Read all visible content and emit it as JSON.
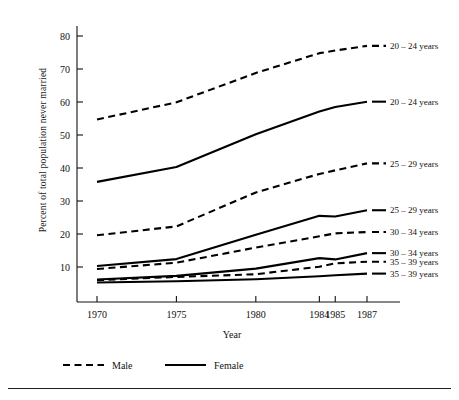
{
  "chart_data": {
    "type": "line",
    "title": "",
    "xlabel": "Year",
    "ylabel": "Percent of total population never married",
    "x": [
      1970,
      1975,
      1980,
      1984,
      1985,
      1987
    ],
    "xtick_labels": [
      "1970",
      "1975",
      "1980",
      "1984",
      "1985",
      "1987"
    ],
    "ytick_labels": [
      "10",
      "20",
      "30",
      "40",
      "50",
      "60",
      "70",
      "80"
    ],
    "yticks": [
      10,
      20,
      30,
      40,
      50,
      60,
      70,
      80
    ],
    "ylim": [
      3,
      84
    ],
    "xlim": [
      1968.6,
      1988.2
    ],
    "grid": false,
    "legend_position": "bottom-left",
    "legend": [
      {
        "name": "Male",
        "style": "dashed"
      },
      {
        "name": "Female",
        "style": "solid"
      }
    ],
    "series": [
      {
        "name": "20 – 24 years",
        "sex": "Male",
        "style": "dashed",
        "label": "20 – 24 years",
        "values": [
          54.7,
          59.9,
          68.8,
          74.8,
          75.6,
          77.0
        ]
      },
      {
        "name": "20 – 24 years",
        "sex": "Female",
        "style": "solid",
        "label": "20 – 24 years",
        "values": [
          35.8,
          40.3,
          50.2,
          57.1,
          58.5,
          60.1
        ]
      },
      {
        "name": "25 – 29 years",
        "sex": "Male",
        "style": "dashed",
        "label": "25 – 29 years",
        "values": [
          19.6,
          22.3,
          32.6,
          38.2,
          39.3,
          41.4
        ]
      },
      {
        "name": "25 – 29 years",
        "sex": "Female",
        "style": "solid",
        "label": "25 – 29 years",
        "values": [
          10.3,
          12.4,
          19.8,
          25.5,
          25.3,
          27.2
        ]
      },
      {
        "name": "30 – 34 years",
        "sex": "Male",
        "style": "dashed",
        "label": "30 – 34 years",
        "values": [
          9.4,
          11.3,
          15.9,
          19.3,
          20.2,
          20.6
        ]
      },
      {
        "name": "30 – 34 years",
        "sex": "Female",
        "style": "solid",
        "label": "30 – 34 years",
        "values": [
          6.2,
          7.3,
          9.5,
          12.7,
          12.3,
          14.2
        ]
      },
      {
        "name": "35 – 39 years",
        "sex": "Male",
        "style": "dashed",
        "label": "35 – 39 years",
        "values": [
          6.0,
          7.0,
          7.8,
          10.1,
          11.1,
          11.6
        ]
      },
      {
        "name": "35 – 39 years",
        "sex": "Female",
        "style": "solid",
        "label": "35 – 39 years",
        "values": [
          5.3,
          5.7,
          6.3,
          7.2,
          7.5,
          8.0
        ]
      }
    ],
    "right_labels": [
      {
        "text": "20 – 24 years",
        "style": "dashed",
        "y": 77.0
      },
      {
        "text": "20 – 24 years",
        "style": "solid",
        "y": 60.1
      },
      {
        "text": "25 – 29 years",
        "style": "dashed",
        "y": 41.4
      },
      {
        "text": "25 – 29 years",
        "style": "solid",
        "y": 27.2
      },
      {
        "text": "30 – 34 years",
        "style": "dashed",
        "y": 20.6
      },
      {
        "text": "30 – 34 years",
        "style": "solid",
        "y": 14.2
      },
      {
        "text": "35 – 39 years",
        "style": "dashed",
        "y": 11.6
      },
      {
        "text": "35 – 39 years",
        "style": "solid",
        "y": 8.0
      }
    ],
    "colors": {
      "line": "#000000",
      "axis": "#111111",
      "background": "#ffffff"
    }
  }
}
